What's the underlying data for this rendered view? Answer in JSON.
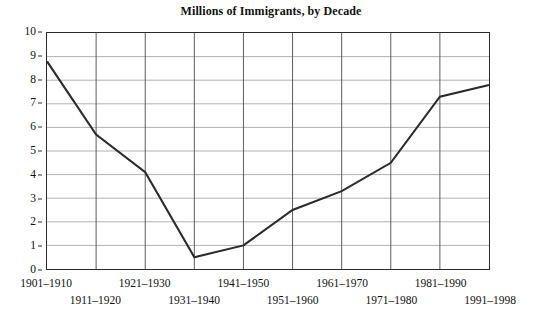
{
  "chart_data": {
    "type": "line",
    "title": "Millions of Immigrants, by Decade",
    "xlabel": "",
    "ylabel": "",
    "categories": [
      "1901–1910",
      "1911–1920",
      "1921–1930",
      "1931–1940",
      "1941–1950",
      "1951–1960",
      "1961–1970",
      "1971–1980",
      "1981–1990",
      "1991–1998"
    ],
    "values": [
      8.8,
      5.7,
      4.1,
      0.5,
      1.0,
      2.5,
      3.3,
      4.5,
      7.3,
      7.8
    ],
    "ylim": [
      0,
      10
    ],
    "y_ticks": [
      0,
      1,
      2,
      3,
      4,
      5,
      6,
      7,
      8,
      9,
      10
    ],
    "y_tick_labels": [
      "0",
      "1",
      "2",
      "3",
      "4",
      "5",
      "6",
      "7",
      "8",
      "9",
      "10"
    ],
    "grid": true,
    "legend": false,
    "series": [
      {
        "name": "Immigrants (millions)",
        "values": [
          8.8,
          5.7,
          4.1,
          0.5,
          1.0,
          2.5,
          3.3,
          4.5,
          7.3,
          7.8
        ]
      }
    ],
    "colors": {
      "line": "#2b2b2b",
      "horizontal_grid": "#a8a8a8",
      "vertical_grid": "#4a4a4a",
      "frame": "#2b2b2b",
      "text": "#111111",
      "background": "#ffffff"
    }
  }
}
